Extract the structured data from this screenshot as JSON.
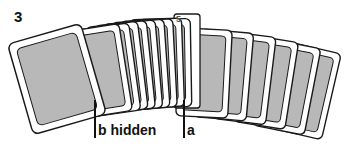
{
  "figure": {
    "number": "3",
    "card_count": 17,
    "face_up_card_index": "5",
    "labels": {
      "b": "b hidden",
      "a": "a"
    },
    "colors": {
      "card_back_fill": "#b8b8b8",
      "card_border": "#1a1a1a",
      "card_margin": "#ffffff",
      "ink": "#111111"
    }
  }
}
